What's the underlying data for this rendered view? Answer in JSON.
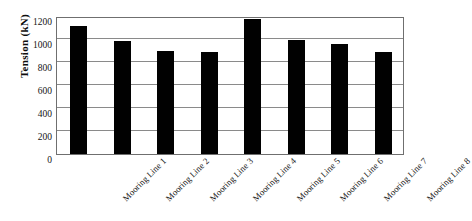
{
  "chart_data": {
    "type": "bar",
    "title": "",
    "xlabel": "",
    "ylabel": "Tension (kN)",
    "categories": [
      "Mooring Line 1",
      "Mooring Line 2",
      "Mooring Line 3",
      "Mooring Line 4",
      "Mooring Line 5",
      "Mooring Line 6",
      "Mooring Line 7",
      "Mooring Line 8"
    ],
    "values": [
      1110,
      985,
      895,
      885,
      1170,
      990,
      960,
      885
    ],
    "ylim": [
      0,
      1200
    ],
    "ytick_values": [
      0,
      200,
      400,
      600,
      800,
      1000,
      1200
    ],
    "ytick_labels": [
      "0",
      "200",
      "400",
      "600",
      "800",
      "1000",
      "1200"
    ],
    "grid": "horizontal",
    "legend": "none",
    "bar_color": "#010101",
    "gridline_color": "#8a8a8a",
    "axis_color": "#6f6f6f",
    "background_color": "#ffffff"
  }
}
